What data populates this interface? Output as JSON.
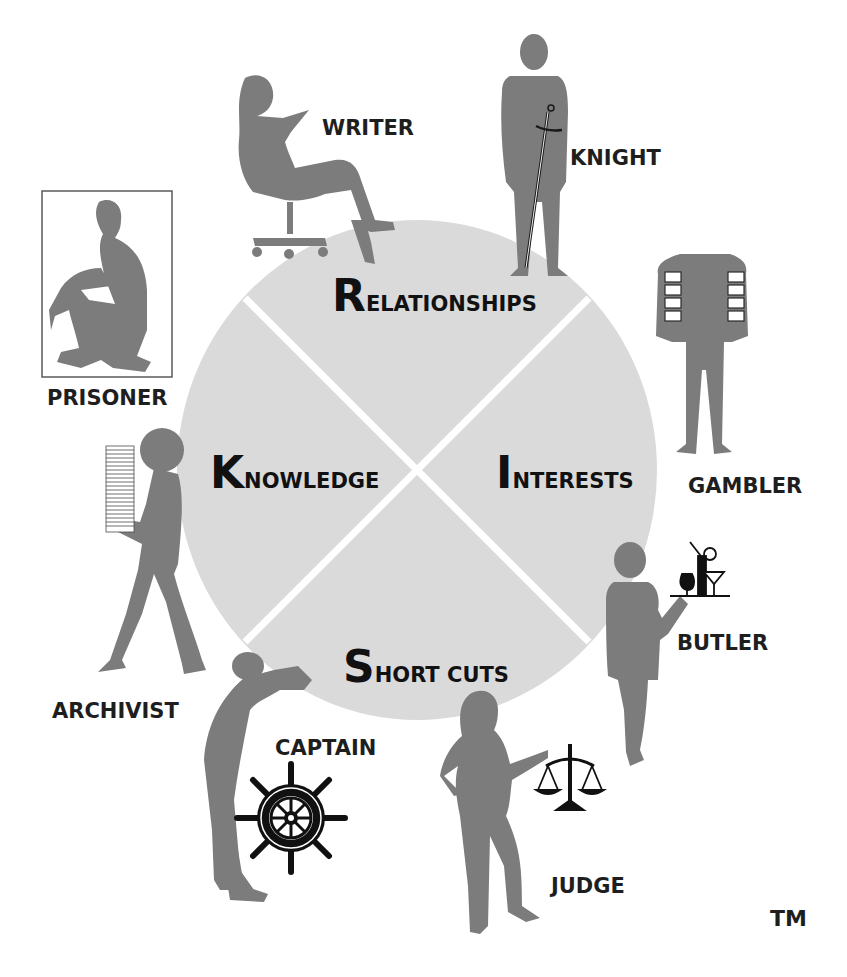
{
  "diagram": {
    "type": "four-quadrant circle with surrounding archetype figures",
    "circle": {
      "fill": "#dadada",
      "divider_color": "#ffffff"
    },
    "silhouette_color": "#7c7c7c",
    "quadrants": [
      {
        "id": "relationships",
        "initial": "R",
        "rest": "ELATIONSHIPS",
        "position": "top"
      },
      {
        "id": "knowledge",
        "initial": "K",
        "rest": "NOWLEDGE",
        "position": "left"
      },
      {
        "id": "interests",
        "initial": "I",
        "rest": "NTERESTS",
        "position": "right"
      },
      {
        "id": "short-cuts",
        "initial": "S",
        "rest": "HORT CUTS",
        "position": "bottom"
      }
    ],
    "figures": [
      {
        "id": "writer",
        "label": "WRITER",
        "prop": "office chair"
      },
      {
        "id": "knight",
        "label": "KNIGHT",
        "prop": "sword"
      },
      {
        "id": "prisoner",
        "label": "PRISONER",
        "prop": "cell frame"
      },
      {
        "id": "gambler",
        "label": "GAMBLER",
        "prop": "cards up sleeves"
      },
      {
        "id": "archivist",
        "label": "ARCHIVIST",
        "prop": "stack of papers"
      },
      {
        "id": "butler",
        "label": "BUTLER",
        "prop": "drinks tray"
      },
      {
        "id": "captain",
        "label": "CAPTAIN",
        "prop": "ship wheel"
      },
      {
        "id": "judge",
        "label": "JUDGE",
        "prop": "scales of justice"
      }
    ],
    "trademark": "TM"
  }
}
